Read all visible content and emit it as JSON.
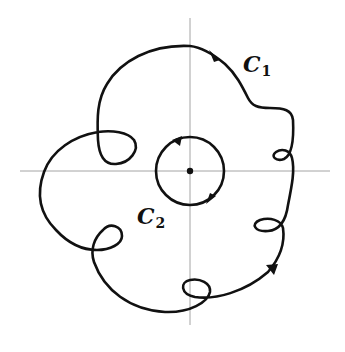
{
  "figure": {
    "colors": {
      "curve": "#111111",
      "axes": "#9a9a9a",
      "background": "#ffffff"
    },
    "axes": {
      "horizontal": {
        "x1": 20,
        "y1": 171,
        "x2": 330,
        "y2": 171
      },
      "vertical": {
        "x1": 190,
        "y1": 18,
        "x2": 190,
        "y2": 325
      }
    },
    "origin": {
      "cx": 190,
      "cy": 171,
      "r": 3.2
    },
    "contours": [
      {
        "id": "C1",
        "label_main": "C",
        "label_sub": "1",
        "orientation": "counterclockwise",
        "self_loops": 5,
        "arrows": 2
      },
      {
        "id": "C2",
        "label_main": "C",
        "label_sub": "2",
        "orientation": "counterclockwise",
        "shape": "circle",
        "center": [
          190,
          171
        ],
        "radius": 34,
        "arrows": 2
      }
    ]
  }
}
